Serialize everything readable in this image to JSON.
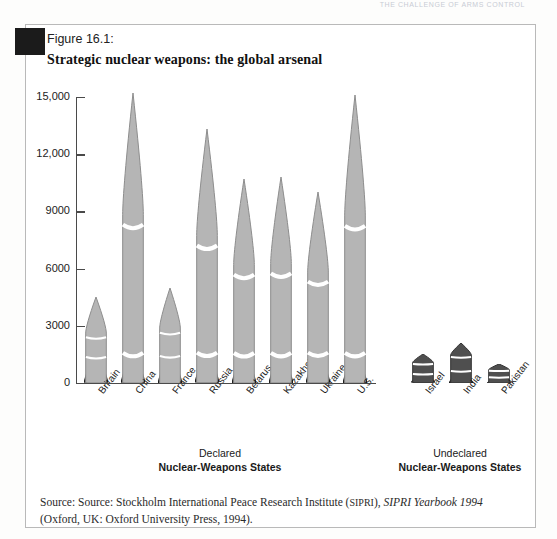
{
  "running_head": "THE CHALLENGE OF ARMS CONTROL",
  "figure": {
    "number": "Figure 16.1:",
    "title": "Strategic nuclear weapons: the global arsenal"
  },
  "groups": {
    "declared": {
      "line1": "Declared",
      "line2": "Nuclear-Weapons States"
    },
    "undeclared": {
      "line1": "Undeclared",
      "line2": "Nuclear-Weapons States"
    }
  },
  "source": {
    "line1_pre": "Source: Source: Stockholm International Peace Research Institute (",
    "sipri": "SIPRI",
    "line1_mid": "), ",
    "yearbook": "SIPRI Yearbook 1994",
    "line2": "(Oxford, UK: Oxford University Press, 1994)."
  },
  "colors": {
    "missile_light": "#b5b5b5",
    "missile_dark": "#4f4f4f",
    "axis": "#4a4a4a",
    "frame": "#b9b9b9",
    "corner_mark": "#1b1b1b"
  },
  "chart_data": {
    "type": "bar",
    "title": "Strategic nuclear weapons: the global arsenal",
    "xlabel": "",
    "ylabel": "",
    "ylim": [
      0,
      15000
    ],
    "ytick_labels": [
      "15,000",
      "12,000",
      "9000",
      "6000",
      "3000",
      "0"
    ],
    "ytick_values": [
      15000,
      12000,
      9000,
      6000,
      3000,
      0
    ],
    "grid": false,
    "legend": "none",
    "note": "Bars are drawn as stylized missiles; heights read off the y-axis.",
    "groups": [
      {
        "name": "Declared Nuclear-Weapons States",
        "style": "light",
        "categories": [
          "Britain",
          "China",
          "France",
          "Russia",
          "Belarus",
          "Kazakhstan",
          "Ukraine",
          "U.S."
        ],
        "values": [
          4500,
          15200,
          5000,
          13300,
          10700,
          10800,
          10000,
          15100
        ]
      },
      {
        "name": "Undeclared Nuclear-Weapons States",
        "style": "dark",
        "categories": [
          "Israel",
          "India",
          "Pakistan"
        ],
        "values": [
          1500,
          2100,
          1000
        ]
      }
    ]
  }
}
